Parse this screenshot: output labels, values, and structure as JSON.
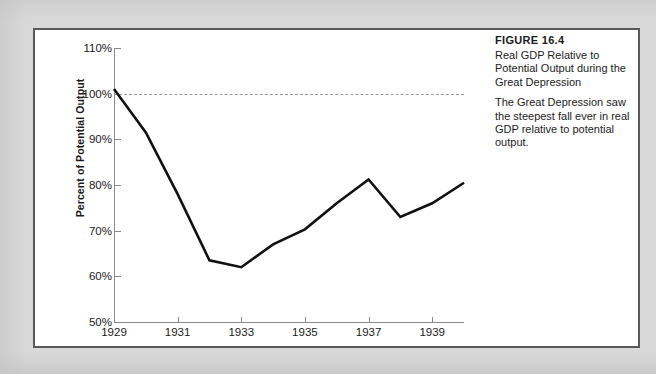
{
  "figure": {
    "label": "FIGURE 16.4",
    "title": "Real GDP Relative to Potential Output during the Great Depression",
    "description": "The Great Depression saw the steepest fall ever in real GDP relative to potential output."
  },
  "colors": {
    "page_background": "#d9d9d9",
    "card_background": "#ffffff",
    "card_border": "#595959",
    "axis": "#8a8a8a",
    "series_line": "#111111",
    "reference_line": "#9a9a9a",
    "text": "#1a1a1a"
  },
  "chart_data": {
    "type": "line",
    "title": "Real GDP Relative to Potential Output during the Great Depression",
    "xlabel": "",
    "ylabel": "Percent of Potential Output",
    "x": [
      1929,
      1930,
      1931,
      1932,
      1933,
      1934,
      1935,
      1936,
      1937,
      1938,
      1939,
      1940
    ],
    "values": [
      101.0,
      91.5,
      78.0,
      63.5,
      62.0,
      67.0,
      70.3,
      76.0,
      81.2,
      73.0,
      76.0,
      80.5
    ],
    "series": [
      {
        "name": "Real GDP as percent of potential output",
        "values": [
          101.0,
          91.5,
          78.0,
          63.5,
          62.0,
          67.0,
          70.3,
          76.0,
          81.2,
          73.0,
          76.0,
          80.5
        ]
      }
    ],
    "xlim": [
      1929,
      1940
    ],
    "ylim": [
      50,
      110
    ],
    "x_ticks": [
      1929,
      1931,
      1933,
      1935,
      1937,
      1939
    ],
    "x_tick_labels": [
      "1929",
      "1931",
      "1933",
      "1935",
      "1937",
      "1939"
    ],
    "y_ticks": [
      50,
      60,
      70,
      80,
      90,
      100,
      110
    ],
    "y_tick_labels": [
      "50%",
      "60%",
      "70%",
      "80%",
      "90%",
      "100%",
      "110%"
    ],
    "grid": false,
    "legend": "none",
    "annotations": [
      {
        "name": "potential-output-reference",
        "type": "horizontal-dashed-line",
        "value": 100,
        "label": "100% of potential output"
      }
    ]
  }
}
